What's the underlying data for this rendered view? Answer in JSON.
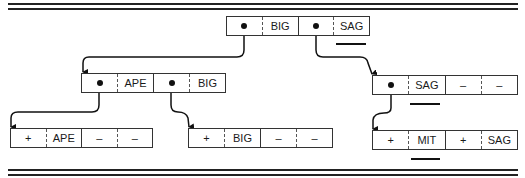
{
  "diagram": {
    "type": "tree",
    "nodes": [
      {
        "id": "root",
        "cells": [
          {
            "kind": "pointer",
            "value": ""
          },
          {
            "kind": "key",
            "value": "BIG"
          },
          {
            "kind": "pointer",
            "value": ""
          },
          {
            "kind": "key",
            "value": "SAG",
            "underlined": true
          }
        ]
      },
      {
        "id": "left-internal",
        "cells": [
          {
            "kind": "pointer",
            "value": ""
          },
          {
            "kind": "key",
            "value": "APE"
          },
          {
            "kind": "pointer",
            "value": ""
          },
          {
            "kind": "key",
            "value": "BIG"
          }
        ]
      },
      {
        "id": "right-internal",
        "cells": [
          {
            "kind": "pointer",
            "value": ""
          },
          {
            "kind": "key",
            "value": "SAG",
            "underlined": true
          },
          {
            "kind": "flag",
            "value": "–"
          },
          {
            "kind": "key",
            "value": "–"
          }
        ]
      },
      {
        "id": "leaf-1",
        "cells": [
          {
            "kind": "flag",
            "value": "+"
          },
          {
            "kind": "key",
            "value": "APE"
          },
          {
            "kind": "flag",
            "value": "–"
          },
          {
            "kind": "key",
            "value": "–"
          }
        ]
      },
      {
        "id": "leaf-2",
        "cells": [
          {
            "kind": "flag",
            "value": "+"
          },
          {
            "kind": "key",
            "value": "BIG"
          },
          {
            "kind": "flag",
            "value": "–"
          },
          {
            "kind": "key",
            "value": "–"
          }
        ]
      },
      {
        "id": "leaf-3",
        "cells": [
          {
            "kind": "flag",
            "value": "+"
          },
          {
            "kind": "key",
            "value": "MIT",
            "underlined": true
          },
          {
            "kind": "flag",
            "value": "+"
          },
          {
            "kind": "key",
            "value": "SAG"
          }
        ]
      }
    ],
    "edges": [
      {
        "from": "root.cell0",
        "to": "left-internal"
      },
      {
        "from": "root.cell2",
        "to": "right-internal"
      },
      {
        "from": "left-internal.cell0",
        "to": "leaf-1"
      },
      {
        "from": "left-internal.cell2",
        "to": "leaf-2"
      },
      {
        "from": "right-internal.cell0",
        "to": "leaf-3"
      }
    ]
  },
  "labels": {
    "root": [
      "",
      "BIG",
      "",
      "SAG"
    ],
    "left_internal": [
      "",
      "APE",
      "",
      "BIG"
    ],
    "right_internal": [
      "",
      "SAG",
      "–",
      "–"
    ],
    "leaf_1": [
      "+",
      "APE",
      "–",
      "–"
    ],
    "leaf_2": [
      "+",
      "BIG",
      "–",
      "–"
    ],
    "leaf_3": [
      "+",
      "MIT",
      "+",
      "SAG"
    ]
  }
}
